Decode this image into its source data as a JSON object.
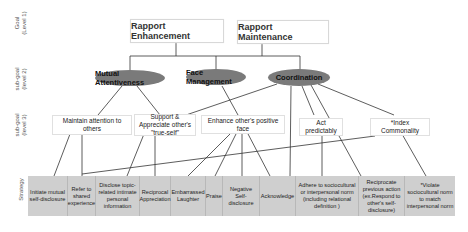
{
  "levels": {
    "goal": "Goal\n(Level 1)",
    "subgoal2": "sub-goal\n(level 2)",
    "subgoal3": "sub-goal\n(level 3)",
    "strategy": "Strategy"
  },
  "goals": [
    {
      "label": "Rapport Enhancement"
    },
    {
      "label": "Rapport Maintenance"
    }
  ],
  "subgoals_level2": [
    {
      "label": "Mutual Attentiveness"
    },
    {
      "label": "Face Management"
    },
    {
      "label": "Coordination"
    }
  ],
  "subgoals_level3": [
    {
      "label": "Maintain attention to others"
    },
    {
      "label": "Support & Appreciate other's \"true-self\""
    },
    {
      "label": "Enhance other's positive face"
    },
    {
      "label": "Act predictably"
    },
    {
      "label": "*Index Commonality"
    }
  ],
  "strategies": [
    {
      "label": "Initiate mutual self-disclosure"
    },
    {
      "label": "Refer to shared experience"
    },
    {
      "label": "Disclose topic-related intimate personal information"
    },
    {
      "label": "Reciprocal Appreciation"
    },
    {
      "label": "Embarrassed Laughter"
    },
    {
      "label": "Praise"
    },
    {
      "label": "Negative Self-disclosure"
    },
    {
      "label": "Acknowledge"
    },
    {
      "label": "Adhere to sociocultural or interpersonal norm (including relational definition )"
    },
    {
      "label": "Reciprocate previous action (ex.Respond to other's self-disclosure)"
    },
    {
      "label": "*Violate sociocultural norm to match interpersonal norm"
    }
  ],
  "colors": {
    "ellipse_fill": "#7a7a7a",
    "strategy_fill": "#cfcfcf",
    "line": "#333333"
  }
}
